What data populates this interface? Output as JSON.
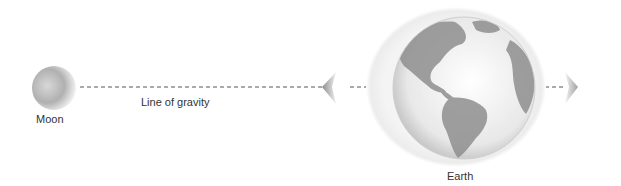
{
  "diagram": {
    "bodies": {
      "moon": {
        "label": "Moon"
      },
      "earth": {
        "label": "Earth"
      }
    },
    "line": {
      "label": "Line of gravity"
    },
    "colors": {
      "background": "#ffffff",
      "text": "#333333",
      "dash": "#555555",
      "land": "#8a8a8a",
      "ocean": "#e6e6e6",
      "halo": "#efefef"
    }
  }
}
